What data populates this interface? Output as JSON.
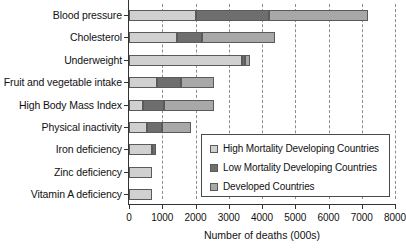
{
  "chart_data": {
    "type": "bar",
    "orientation": "horizontal",
    "stacked": true,
    "title": "",
    "xlabel": "Number of deaths (000s)",
    "ylabel": "",
    "xlim": [
      0,
      8000
    ],
    "xticks": [
      0,
      1000,
      2000,
      3000,
      4000,
      5000,
      6000,
      7000,
      8000
    ],
    "xtick_labels": [
      "0",
      "1000",
      "2000",
      "3000",
      "4000",
      "5000",
      "6000",
      "7000",
      "8000"
    ],
    "grid": "vertical-dashed",
    "legend_position": "inside-lower-right",
    "categories": [
      "Blood pressure",
      "Cholesterol",
      "Underweight",
      "Fruit and vegetable intake",
      "High Body Mass Index",
      "Physical inactivity",
      "Iron deficiency",
      "Zinc deficiency",
      "Vitamin A deficiency"
    ],
    "series": [
      {
        "name": "High Mortality Developing Countries",
        "color": "#d0d0d0",
        "values": [
          2000,
          1450,
          3400,
          850,
          420,
          550,
          700,
          700,
          680
        ]
      },
      {
        "name": "Low Mortality Developing Countries",
        "color": "#6e6e6e",
        "values": [
          2200,
          750,
          100,
          700,
          630,
          450,
          100,
          0,
          0
        ]
      },
      {
        "name": "Developed Countries",
        "color": "#a8a8a8",
        "values": [
          3000,
          2200,
          150,
          1000,
          1500,
          850,
          0,
          0,
          0
        ]
      }
    ],
    "totals": [
      7200,
      4400,
      3650,
      2550,
      2550,
      1850,
      800,
      700,
      680
    ]
  },
  "legend": {
    "entries": [
      {
        "label": "High Mortality Developing Countries",
        "swatch": "high"
      },
      {
        "label": "Low Mortality Developing Countries",
        "swatch": "low"
      },
      {
        "label": "Developed Countries",
        "swatch": "dev"
      }
    ]
  }
}
